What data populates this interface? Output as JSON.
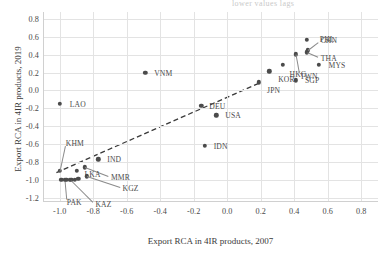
{
  "chart_data": {
    "type": "scatter",
    "title": "",
    "xlabel": "Export RCA in 4IR products, 2007",
    "ylabel": "Export RCA in 4IR products, 2019",
    "xlim": [
      -1.1,
      0.9
    ],
    "ylim": [
      -1.25,
      0.88
    ],
    "xticks": [
      "-1.0",
      "-0.8",
      "-0.6",
      "-0.4",
      "-0.2",
      "0.0",
      "0.2",
      "0.4",
      "0.6",
      "0.8"
    ],
    "xtick_values": [
      -1.0,
      -0.8,
      -0.6,
      -0.4,
      -0.2,
      0.0,
      0.2,
      0.4,
      0.6,
      0.8
    ],
    "yticks": [
      "0.8",
      "0.6",
      "0.4",
      "0.2",
      "0.0",
      "-0.2",
      "-0.4",
      "-0.6",
      "-0.8",
      "-1.0",
      "-1.2"
    ],
    "ytick_values": [
      0.8,
      0.6,
      0.4,
      0.2,
      0.0,
      -0.2,
      -0.4,
      -0.6,
      -0.8,
      -1.0,
      -1.2
    ],
    "grid": true,
    "legend": "none",
    "marker_color": "#4b4b4b",
    "grid_color": "#e3e3e3",
    "trendline": {
      "style": "dashed",
      "color": "#3a3a3a",
      "x": [
        -1.02,
        0.2
      ],
      "y": [
        -0.92,
        0.09
      ]
    },
    "points": [
      {
        "label": "LAO",
        "x": -1.0,
        "y": -0.15,
        "lx": 10,
        "ly": 0
      },
      {
        "label": "KHM",
        "x": -1.0,
        "y": -0.9,
        "lx": 6,
        "ly": -28,
        "leader": true
      },
      {
        "label": "IND",
        "x": -0.77,
        "y": -0.77,
        "lx": 9,
        "ly": 0
      },
      {
        "label": "MMR",
        "x": -0.85,
        "y": -0.86,
        "lx": 26,
        "ly": 10,
        "leader": true
      },
      {
        "label": "LKA",
        "x": -0.9,
        "y": -0.9,
        "lx": 8,
        "ly": 3
      },
      {
        "label": "KGZ",
        "x": -0.84,
        "y": -0.96,
        "lx": 36,
        "ly": 12,
        "leader": true
      },
      {
        "label": "PAK",
        "x": -0.97,
        "y": -1.0,
        "lx": 2,
        "ly": 22,
        "leader": true
      },
      {
        "label": "KAZ",
        "x": -0.93,
        "y": -1.0,
        "lx": 24,
        "ly": 24,
        "leader": true
      },
      {
        "label": "BGD",
        "x": -0.99,
        "y": -1.0,
        "lx": 0,
        "ly": 0
      },
      {
        "label": "NPL",
        "x": -0.96,
        "y": -1.0,
        "lx": 0,
        "ly": 0
      },
      {
        "label": "BRN",
        "x": -0.94,
        "y": -1.0,
        "lx": 0,
        "ly": 0
      },
      {
        "label": "MNG",
        "x": -0.91,
        "y": -1.0,
        "lx": 0,
        "ly": 0
      },
      {
        "label": "UZB",
        "x": -0.89,
        "y": -0.99,
        "lx": 0,
        "ly": 0
      },
      {
        "label": "VNM",
        "x": -0.49,
        "y": 0.2,
        "lx": 9,
        "ly": 0
      },
      {
        "label": "DEU",
        "x": -0.155,
        "y": -0.17,
        "lx": 8,
        "ly": 0
      },
      {
        "label": "USA",
        "x": -0.065,
        "y": -0.28,
        "lx": 9,
        "ly": 0
      },
      {
        "label": "IDN",
        "x": -0.135,
        "y": -0.62,
        "lx": 9,
        "ly": 0
      },
      {
        "label": "JPN",
        "x": 0.19,
        "y": 0.09,
        "lx": 8,
        "ly": 8
      },
      {
        "label": "KOR",
        "x": 0.25,
        "y": 0.215,
        "lx": 9,
        "ly": 8
      },
      {
        "label": "SGP",
        "x": 0.41,
        "y": 0.115,
        "lx": 9,
        "ly": 0
      },
      {
        "label": "HKG",
        "x": 0.33,
        "y": 0.285,
        "lx": 7,
        "ly": 9
      },
      {
        "label": "TWN",
        "x": 0.41,
        "y": 0.405,
        "lx": 4,
        "ly": 22,
        "leader": true
      },
      {
        "label": "MYS",
        "x": 0.545,
        "y": 0.285,
        "lx": 10,
        "ly": 0
      },
      {
        "label": "THA",
        "x": 0.475,
        "y": 0.43,
        "lx": 14,
        "ly": 6,
        "leader": true
      },
      {
        "label": "CHN",
        "x": 0.48,
        "y": 0.45,
        "lx": 13,
        "ly": -10,
        "leader": true
      },
      {
        "label": "PHL",
        "x": 0.475,
        "y": 0.565,
        "lx": 13,
        "ly": -1
      }
    ]
  },
  "top_fragment": "lower values lags"
}
